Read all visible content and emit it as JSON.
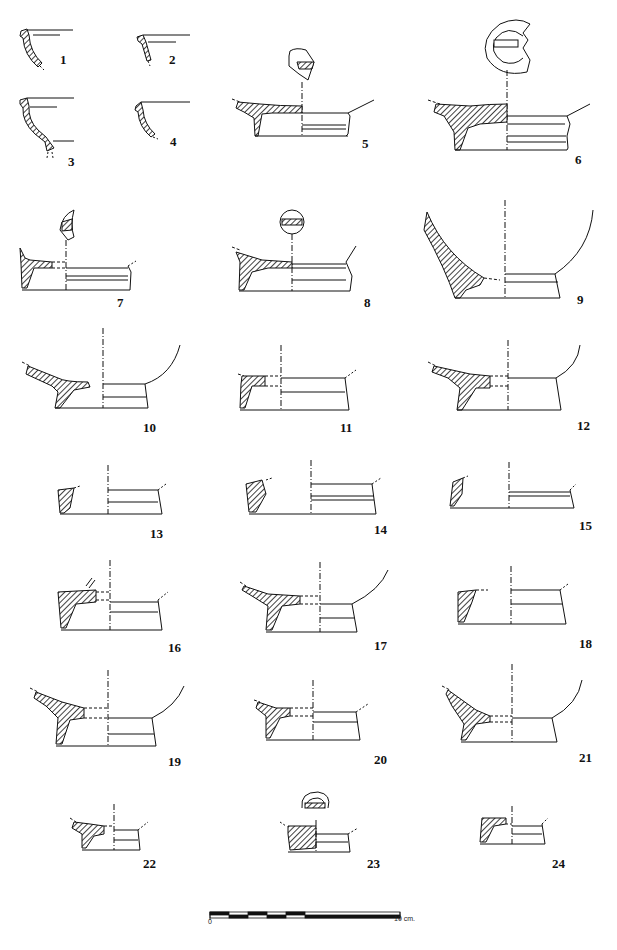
{
  "plate": {
    "type": "archaeological pottery profile drawings (sherd sections)",
    "figures": [
      {
        "id": "1",
        "label": "1",
        "kind": "rim"
      },
      {
        "id": "2",
        "label": "2",
        "kind": "rim"
      },
      {
        "id": "3",
        "label": "3",
        "kind": "rim"
      },
      {
        "id": "4",
        "label": "4",
        "kind": "rim"
      },
      {
        "id": "5",
        "label": "5",
        "kind": "base",
        "stamp": "rectangular stamp fragment"
      },
      {
        "id": "6",
        "label": "6",
        "kind": "base",
        "stamp": "circular stamp with rectangular cartouche"
      },
      {
        "id": "7",
        "label": "7",
        "kind": "base",
        "stamp": "crescent stamp fragment"
      },
      {
        "id": "8",
        "label": "8",
        "kind": "base",
        "stamp": "circular stamp with cartouche"
      },
      {
        "id": "9",
        "label": "9",
        "kind": "base"
      },
      {
        "id": "10",
        "label": "10",
        "kind": "base"
      },
      {
        "id": "11",
        "label": "11",
        "kind": "base"
      },
      {
        "id": "12",
        "label": "12",
        "kind": "base"
      },
      {
        "id": "13",
        "label": "13",
        "kind": "base"
      },
      {
        "id": "14",
        "label": "14",
        "kind": "base"
      },
      {
        "id": "15",
        "label": "15",
        "kind": "base"
      },
      {
        "id": "16",
        "label": "16",
        "kind": "base"
      },
      {
        "id": "17",
        "label": "17",
        "kind": "base"
      },
      {
        "id": "18",
        "label": "18",
        "kind": "base"
      },
      {
        "id": "19",
        "label": "19",
        "kind": "base"
      },
      {
        "id": "20",
        "label": "20",
        "kind": "base"
      },
      {
        "id": "21",
        "label": "21",
        "kind": "base"
      },
      {
        "id": "22",
        "label": "22",
        "kind": "base"
      },
      {
        "id": "23",
        "label": "23",
        "kind": "base",
        "stamp": "semi-circular stamp fragment"
      },
      {
        "id": "24",
        "label": "24",
        "kind": "base"
      }
    ],
    "scale_bar": {
      "start_label": "0",
      "end_label": "10 cm."
    }
  }
}
